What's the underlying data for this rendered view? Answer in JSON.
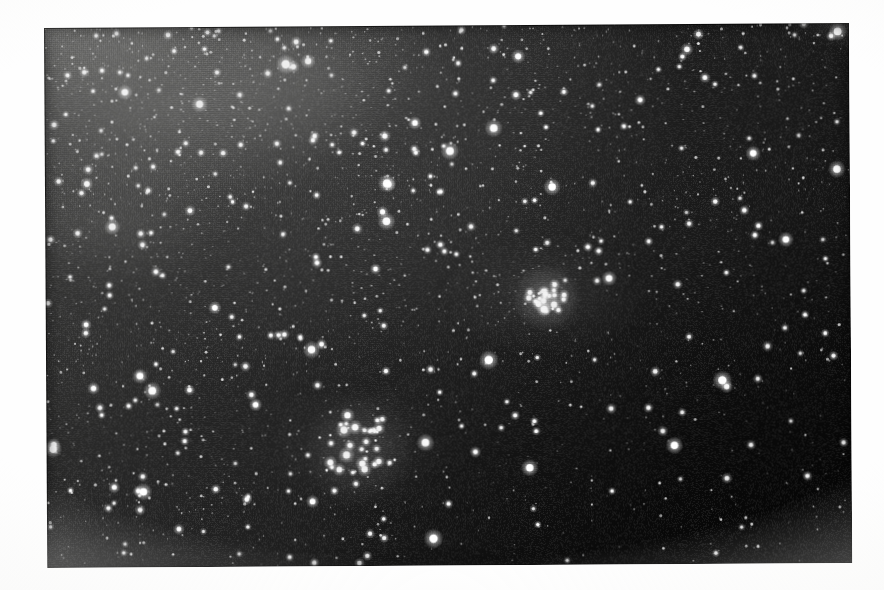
{
  "page": {
    "background_color": "#ffffff",
    "margin_tint_color": "#f6f6f4",
    "caption": ""
  },
  "plate": {
    "title": "",
    "kind": "astronomical-photograph",
    "subject": "dense Milky Way star field with open star cluster",
    "frame": {
      "left": 44,
      "top": 28,
      "width": 805,
      "height": 540,
      "rotation_deg": -0.35
    },
    "sky_background_color": "#141414",
    "star_color": "#ffffff",
    "bright_region_color": "#8a8a88",
    "dark_region_color": "#090909",
    "texture": "halftone-screen"
  },
  "features": [
    {
      "name": "compact-star-cluster",
      "label": "compact bright open cluster",
      "center_x": 545,
      "center_y": 301,
      "radius": 18,
      "brightness": "high",
      "star_count": 26
    },
    {
      "name": "loose-star-group",
      "label": "loose star grouping",
      "center_x": 356,
      "center_y": 452,
      "radius": 42,
      "brightness": "medium",
      "star_count": 34
    },
    {
      "name": "milky-way-star-cloud",
      "label": "bright star cloud (upper left)",
      "center_x": 150,
      "center_y": 105,
      "radius": 130,
      "brightness": "high",
      "star_count": 0
    }
  ],
  "chart_data": {
    "type": "scatter",
    "xlabel": "",
    "ylabel": "",
    "background": "#141414",
    "point_color": "#ffffff",
    "total_stars": 2600,
    "density_gradient": {
      "description": "star surface density decreases from upper-left to lower-right",
      "upper_left_relative_density": 1.0,
      "lower_right_relative_density": 0.18
    },
    "brightness_percentiles": {
      "faint": 0.7,
      "medium": 0.22,
      "bright": 0.07,
      "very_bright": 0.01
    },
    "clusters": [
      {
        "name": "compact-star-cluster",
        "x": 0.622,
        "y": 0.506,
        "members": 26,
        "angular_radius_px": 18
      },
      {
        "name": "loose-star-group",
        "x": 0.388,
        "y": 0.785,
        "members": 34,
        "angular_radius_px": 42
      }
    ]
  }
}
